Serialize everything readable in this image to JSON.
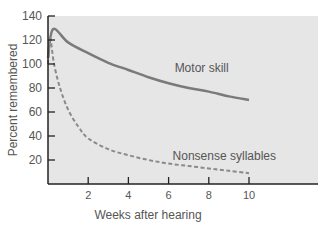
{
  "chart_data": {
    "type": "line",
    "title": "",
    "xlabel": "Weeks after hearing",
    "ylabel": "Percent remembered",
    "xlim": [
      0,
      13.5
    ],
    "ylim": [
      0,
      140
    ],
    "xticks": [
      2,
      4,
      6,
      8,
      10
    ],
    "yticks": [
      20,
      40,
      60,
      80,
      100,
      120,
      140
    ],
    "grid": false,
    "legend": "inline labels",
    "series": [
      {
        "name": "Motor skill",
        "style": "solid",
        "x": [
          0,
          0.25,
          1,
          2,
          3,
          4,
          5,
          6,
          7,
          8,
          9,
          10
        ],
        "y": [
          105,
          129,
          118,
          109,
          101,
          95,
          89,
          84,
          80,
          77,
          73,
          70
        ]
      },
      {
        "name": "Nonsense syllables",
        "style": "dashed",
        "x": [
          0,
          0.1,
          0.3,
          0.6,
          1,
          1.5,
          2,
          3,
          4,
          5,
          6,
          7,
          8,
          9,
          10
        ],
        "y": [
          100,
          122,
          100,
          80,
          62,
          48,
          38,
          29,
          24,
          20,
          17,
          15,
          13,
          11,
          9
        ]
      }
    ],
    "annotations": [
      {
        "text": "Motor skill",
        "x": 6.3,
        "y": 93
      },
      {
        "text": "Nonsense syllables",
        "x": 6.2,
        "y": 20
      }
    ]
  },
  "colors": {
    "plot_bg": "#e6e6e6",
    "motor_line": "#7a7a7a",
    "syllable_line": "#8a8a8a",
    "axis": "#222222",
    "text": "#555555"
  }
}
